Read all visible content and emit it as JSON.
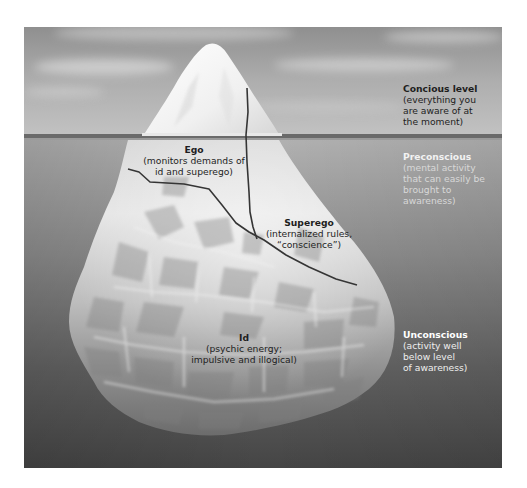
{
  "diagram": {
    "type": "iceberg-model-of-mind",
    "colors": {
      "sky_top": "#9a9a9a",
      "sky_bottom": "#bdbdbd",
      "water_line": "#6e6e6e",
      "water_top": "#b0b0b0",
      "water_bottom": "#4a4a4a",
      "ice_light": "#f4f4f4",
      "ice_shadow": "#8a8a8a",
      "boundary_line": "#3a3a3a"
    },
    "levels": [
      {
        "id": "conscious",
        "title": "Concious level",
        "description_lines": [
          "(everything you",
          "are aware of at",
          "the moment)"
        ]
      },
      {
        "id": "preconscious",
        "title": "Preconscious",
        "description_lines": [
          "(mental activity",
          "that can easily be",
          "brought to",
          "awareness)"
        ]
      },
      {
        "id": "unconscious",
        "title": "Unconscious",
        "description_lines": [
          "(activity well",
          "below level",
          "of awareness)"
        ]
      }
    ],
    "structures": [
      {
        "id": "ego",
        "title": "Ego",
        "description_lines": [
          "(monitors demands of",
          "id and superego)"
        ]
      },
      {
        "id": "superego",
        "title": "Superego",
        "description_lines": [
          "(internalized rules,",
          "“conscience”)"
        ]
      },
      {
        "id": "id",
        "title": "Id",
        "description_lines": [
          "(psychic energy;",
          "impulsive and illogical)"
        ]
      }
    ]
  }
}
